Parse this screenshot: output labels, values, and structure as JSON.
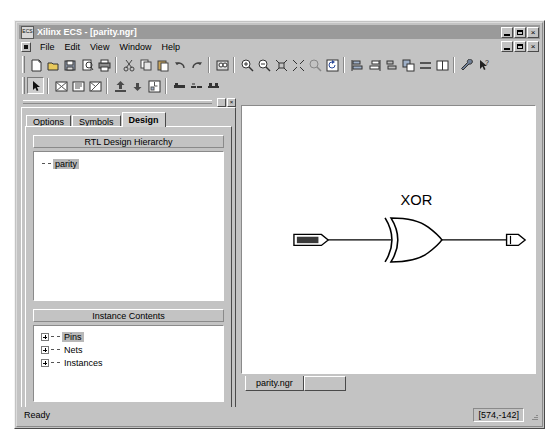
{
  "window": {
    "title": "Xilinx ECS - [parity.ngr]",
    "icon": "ecs-icon",
    "icon_text": "ECS",
    "controls": {
      "minimize": "_",
      "maximize": "□",
      "close": "×"
    },
    "mdi_controls": {
      "minimize": "_",
      "restore": "⧉",
      "close": "×"
    }
  },
  "menu": {
    "items": [
      {
        "label": "File"
      },
      {
        "label": "Edit"
      },
      {
        "label": "View"
      },
      {
        "label": "Window"
      },
      {
        "label": "Help"
      }
    ]
  },
  "toolbars": {
    "row1": [
      {
        "name": "new-icon",
        "tip": "New"
      },
      {
        "name": "open-icon",
        "tip": "Open"
      },
      {
        "name": "save-icon",
        "tip": "Save"
      },
      {
        "name": "print-preview-icon",
        "tip": "Print Preview"
      },
      {
        "name": "print-icon",
        "tip": "Print"
      },
      {
        "name": "cut-icon",
        "tip": "Cut"
      },
      {
        "name": "copy-icon",
        "tip": "Copy"
      },
      {
        "name": "paste-icon",
        "tip": "Paste"
      },
      {
        "name": "undo-icon",
        "tip": "Undo"
      },
      {
        "name": "redo-icon",
        "tip": "Redo"
      },
      {
        "name": "find-icon",
        "tip": "Find"
      },
      {
        "name": "zoom-in-icon",
        "tip": "Zoom In"
      },
      {
        "name": "zoom-out-icon",
        "tip": "Zoom Out"
      },
      {
        "name": "zoom-full-icon",
        "tip": "Zoom Full View"
      },
      {
        "name": "zoom-selection-icon",
        "tip": "Zoom To Selection"
      },
      {
        "name": "zoom-area-icon",
        "tip": "Zoom Area"
      },
      {
        "name": "refresh-icon",
        "tip": "Refresh"
      },
      {
        "name": "align-left-icon",
        "tip": "Align Left"
      },
      {
        "name": "align-right-icon",
        "tip": "Align Right"
      },
      {
        "name": "align-middle-icon",
        "tip": "Align Middle"
      },
      {
        "name": "bring-front-icon",
        "tip": "Bring To Front"
      },
      {
        "name": "distribute-icon",
        "tip": "Distribute"
      },
      {
        "name": "columns-icon",
        "tip": "Columns"
      },
      {
        "name": "options-wrench-icon",
        "tip": "Options"
      },
      {
        "name": "help-pointer-icon",
        "tip": "Context Help"
      }
    ],
    "row2": [
      {
        "name": "select-arrow-icon",
        "tip": "Select",
        "pressed": true
      },
      {
        "name": "add-symbol-icon",
        "tip": "Add Symbol"
      },
      {
        "name": "symbol-wizard-icon",
        "tip": "Symbol Wizard"
      },
      {
        "name": "edit-symbol-icon",
        "tip": "Edit Symbol"
      },
      {
        "name": "push-into-icon",
        "tip": "Push Into Symbol"
      },
      {
        "name": "pop-out-icon",
        "tip": "Pop Out Of Symbol"
      },
      {
        "name": "hierarchy-icon",
        "tip": "Hierarchy"
      },
      {
        "name": "add-wire-icon",
        "tip": "Add Wire"
      },
      {
        "name": "add-bus-icon",
        "tip": "Add Bus"
      },
      {
        "name": "add-bus-tap-icon",
        "tip": "Add Bus Tap"
      }
    ]
  },
  "panel": {
    "caption_buttons": {
      "pin": "▫",
      "close": "×"
    },
    "tabs": [
      {
        "label": "Options",
        "active": false
      },
      {
        "label": "Symbols",
        "active": false
      },
      {
        "label": "Design",
        "active": true
      }
    ],
    "hierarchy": {
      "title": "RTL Design Hierarchy",
      "nodes": [
        {
          "label": "parity",
          "selected": true
        }
      ]
    },
    "instance_contents": {
      "title": "Instance Contents",
      "nodes": [
        {
          "label": "Pins",
          "selected": true
        },
        {
          "label": "Nets",
          "selected": false
        },
        {
          "label": "Instances",
          "selected": false
        }
      ]
    }
  },
  "document": {
    "tab_label": "parity.ngr",
    "schematic": {
      "gate_label": "XOR",
      "input_port_label": "A",
      "output_port_label": ""
    }
  },
  "statusbar": {
    "message": "Ready",
    "coordinates": "[574,-142]"
  }
}
